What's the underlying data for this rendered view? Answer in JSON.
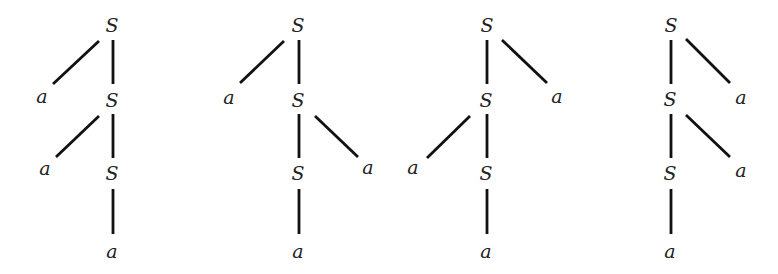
{
  "figure": {
    "nonterminal_symbol": "S",
    "terminal_symbol": "a",
    "edge_color": "#111111",
    "label_color": "#222222"
  },
  "trees": [
    {
      "id": "tree-1",
      "nodes": [
        {
          "id": "t1-s1",
          "label": "S",
          "x": 112,
          "y": 25
        },
        {
          "id": "t1-a1",
          "label": "a",
          "x": 42,
          "y": 96
        },
        {
          "id": "t1-s2",
          "label": "S",
          "x": 112,
          "y": 100
        },
        {
          "id": "t1-a2",
          "label": "a",
          "x": 45,
          "y": 168
        },
        {
          "id": "t1-s3",
          "label": "S",
          "x": 112,
          "y": 173
        },
        {
          "id": "t1-a3",
          "label": "a",
          "x": 112,
          "y": 251
        }
      ],
      "edges": [
        {
          "from": "t1-s1",
          "to": "t1-a1",
          "x1": 99,
          "y1": 41,
          "x2": 53,
          "y2": 84
        },
        {
          "from": "t1-s1",
          "to": "t1-s2",
          "x1": 113,
          "y1": 40,
          "x2": 113,
          "y2": 84
        },
        {
          "from": "t1-s2",
          "to": "t1-a2",
          "x1": 99,
          "y1": 116,
          "x2": 56,
          "y2": 157
        },
        {
          "from": "t1-s2",
          "to": "t1-s3",
          "x1": 113,
          "y1": 114,
          "x2": 113,
          "y2": 158
        },
        {
          "from": "t1-s3",
          "to": "t1-a3",
          "x1": 113,
          "y1": 189,
          "x2": 113,
          "y2": 234
        }
      ]
    },
    {
      "id": "tree-2",
      "nodes": [
        {
          "id": "t2-s1",
          "label": "S",
          "x": 298,
          "y": 25
        },
        {
          "id": "t2-a1",
          "label": "a",
          "x": 229,
          "y": 97
        },
        {
          "id": "t2-s2",
          "label": "S",
          "x": 298,
          "y": 100
        },
        {
          "id": "t2-a2",
          "label": "a",
          "x": 368,
          "y": 167
        },
        {
          "id": "t2-s3",
          "label": "S",
          "x": 298,
          "y": 173
        },
        {
          "id": "t2-a3",
          "label": "a",
          "x": 298,
          "y": 251
        }
      ],
      "edges": [
        {
          "from": "t2-s1",
          "to": "t2-a1",
          "x1": 284,
          "y1": 41,
          "x2": 240,
          "y2": 83
        },
        {
          "from": "t2-s1",
          "to": "t2-s2",
          "x1": 299,
          "y1": 40,
          "x2": 299,
          "y2": 84
        },
        {
          "from": "t2-s2",
          "to": "t2-a2",
          "x1": 315,
          "y1": 116,
          "x2": 358,
          "y2": 157
        },
        {
          "from": "t2-s2",
          "to": "t2-s3",
          "x1": 299,
          "y1": 114,
          "x2": 299,
          "y2": 158
        },
        {
          "from": "t2-s3",
          "to": "t2-a3",
          "x1": 299,
          "y1": 189,
          "x2": 299,
          "y2": 234
        }
      ]
    },
    {
      "id": "tree-3",
      "nodes": [
        {
          "id": "t3-s1",
          "label": "S",
          "x": 487,
          "y": 25
        },
        {
          "id": "t3-a1",
          "label": "a",
          "x": 557,
          "y": 96
        },
        {
          "id": "t3-s2",
          "label": "S",
          "x": 486,
          "y": 100
        },
        {
          "id": "t3-a2",
          "label": "a",
          "x": 413,
          "y": 167
        },
        {
          "id": "t3-s3",
          "label": "S",
          "x": 486,
          "y": 173
        },
        {
          "id": "t3-a3",
          "label": "a",
          "x": 486,
          "y": 251
        }
      ],
      "edges": [
        {
          "from": "t3-s1",
          "to": "t3-a1",
          "x1": 502,
          "y1": 40,
          "x2": 547,
          "y2": 83
        },
        {
          "from": "t3-s1",
          "to": "t3-s2",
          "x1": 487,
          "y1": 40,
          "x2": 487,
          "y2": 84
        },
        {
          "from": "t3-s2",
          "to": "t3-a2",
          "x1": 470,
          "y1": 116,
          "x2": 427,
          "y2": 158
        },
        {
          "from": "t3-s2",
          "to": "t3-s3",
          "x1": 487,
          "y1": 114,
          "x2": 487,
          "y2": 158
        },
        {
          "from": "t3-s3",
          "to": "t3-a3",
          "x1": 487,
          "y1": 189,
          "x2": 487,
          "y2": 234
        }
      ]
    },
    {
      "id": "tree-4",
      "nodes": [
        {
          "id": "t4-s1",
          "label": "S",
          "x": 671,
          "y": 25
        },
        {
          "id": "t4-a1",
          "label": "a",
          "x": 741,
          "y": 97
        },
        {
          "id": "t4-s2",
          "label": "S",
          "x": 670,
          "y": 99
        },
        {
          "id": "t4-a2",
          "label": "a",
          "x": 741,
          "y": 170
        },
        {
          "id": "t4-s3",
          "label": "S",
          "x": 670,
          "y": 173
        },
        {
          "id": "t4-a3",
          "label": "a",
          "x": 670,
          "y": 251
        }
      ],
      "edges": [
        {
          "from": "t4-s1",
          "to": "t4-a1",
          "x1": 686,
          "y1": 39,
          "x2": 730,
          "y2": 83
        },
        {
          "from": "t4-s1",
          "to": "t4-s2",
          "x1": 671,
          "y1": 40,
          "x2": 671,
          "y2": 84
        },
        {
          "from": "t4-s2",
          "to": "t4-a2",
          "x1": 686,
          "y1": 115,
          "x2": 730,
          "y2": 157
        },
        {
          "from": "t4-s2",
          "to": "t4-s3",
          "x1": 671,
          "y1": 114,
          "x2": 671,
          "y2": 158
        },
        {
          "from": "t4-s3",
          "to": "t4-a3",
          "x1": 671,
          "y1": 189,
          "x2": 671,
          "y2": 234
        }
      ]
    }
  ]
}
